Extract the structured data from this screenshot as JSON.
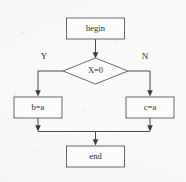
{
  "diagram": {
    "type": "flowchart",
    "colors": {
      "background": "#fafafa",
      "shape_fill": "#fcfcfc",
      "shape_stroke": "#5a5a5a",
      "connector": "#4a4a4a",
      "text": "#2e2e2e"
    },
    "nodes": {
      "begin": {
        "label": "begin",
        "shape": "rectangle"
      },
      "decision": {
        "label": "X=0",
        "shape": "diamond"
      },
      "true_branch": {
        "label": "b=a",
        "shape": "rectangle"
      },
      "false_branch": {
        "label": "c=a",
        "shape": "rectangle"
      },
      "end": {
        "label": "end",
        "shape": "rectangle"
      }
    },
    "edge_labels": {
      "yes": "Y",
      "no": "N"
    }
  }
}
